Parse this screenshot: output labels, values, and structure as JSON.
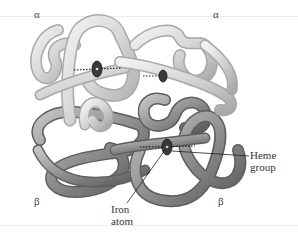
{
  "figure": {
    "subunits": [
      {
        "id": "alpha-left",
        "label": "α",
        "shade": "light"
      },
      {
        "id": "alpha-right",
        "label": "α",
        "shade": "light"
      },
      {
        "id": "beta-left",
        "label": "β",
        "shade": "dark"
      },
      {
        "id": "beta-right",
        "label": "β",
        "shade": "dark"
      }
    ],
    "annotations": {
      "heme": {
        "line1": "Heme",
        "line2": "group"
      },
      "iron": {
        "line1": "Iron",
        "line2": "atom"
      }
    },
    "colors": {
      "alpha_tube": "#d9d9d9",
      "alpha_shadow": "#a8a8a8",
      "beta_tube": "#9a9a9a",
      "beta_shadow": "#5e5e5e",
      "heme_disc": "#3a3a3a",
      "label_text": "#333333",
      "rule": "#e6e6e6"
    }
  }
}
